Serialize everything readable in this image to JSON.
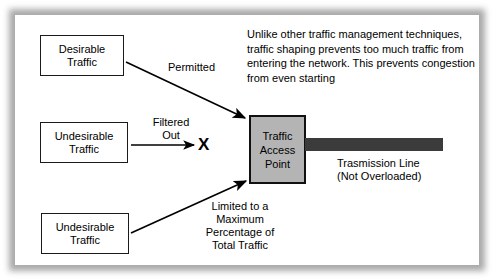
{
  "diagram": {
    "frame": {
      "border_color": "#9a9a9a",
      "background": "#ffffff"
    },
    "paragraph": "Unlike other traffic management techniques, traffic shaping prevents too much traffic from entering the network. This prevents congestion from even starting",
    "nodes": [
      {
        "id": "desirable-traffic",
        "line1": "Desirable",
        "line2": "Traffic",
        "fill": "#ffffff",
        "border": "#1a1a1a"
      },
      {
        "id": "undesirable-traffic-middle",
        "line1": "Undesirable",
        "line2": "Traffic",
        "fill": "#ffffff",
        "border": "#1a1a1a"
      },
      {
        "id": "undesirable-traffic-bottom",
        "line1": "Undesirable",
        "line2": "Traffic",
        "fill": "#ffffff",
        "border": "#1a1a1a"
      }
    ],
    "access_point": {
      "line1": "Traffic",
      "line2": "Access",
      "line3": "Point",
      "fill": "#b4b4b4",
      "border": "#111111"
    },
    "transmission_line": {
      "bar_color": "#3b3b3b",
      "label_line1": "Trasmission Line",
      "label_line2": "(Not Overloaded)"
    },
    "edges": [
      {
        "id": "permitted",
        "label": "Permitted",
        "from": "desirable-traffic",
        "to": "access-point"
      },
      {
        "id": "filtered-out",
        "label_line1": "Filtered",
        "label_line2": "Out",
        "from": "undesirable-traffic-middle",
        "to": "x-mark"
      },
      {
        "id": "limited",
        "label_line1": "Limited to a",
        "label_line2": "Maximum",
        "label_line3": "Percentage of",
        "label_line4": "Total Traffic",
        "from": "undesirable-traffic-bottom",
        "to": "access-point"
      }
    ],
    "x_mark": "X"
  }
}
